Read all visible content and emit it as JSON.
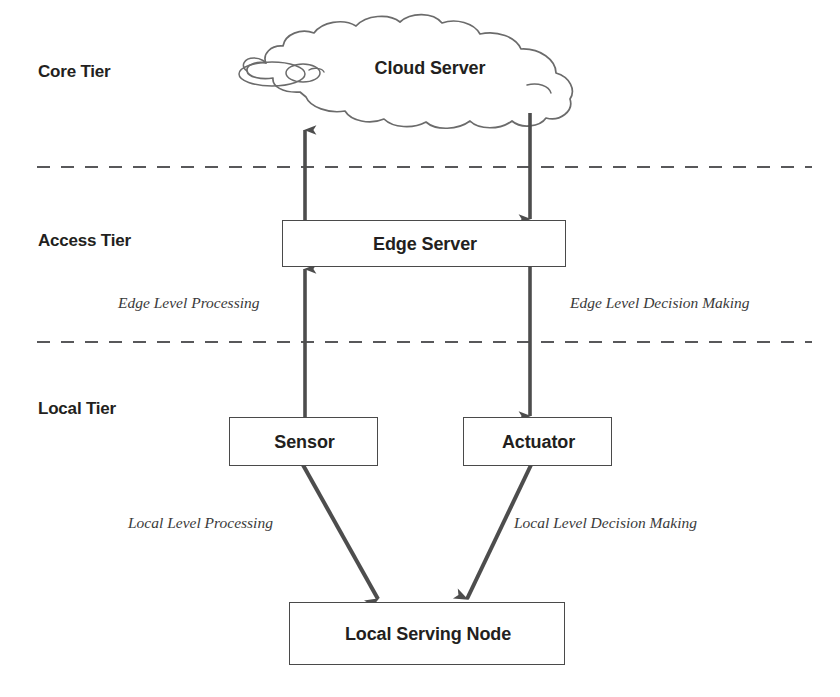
{
  "canvas": {
    "width": 840,
    "height": 697,
    "background": "#ffffff",
    "stroke_color": "#4a4a4a",
    "arrow_color": "#4d4d4d",
    "text_color": "#231f20"
  },
  "tiers": [
    {
      "id": "core",
      "label": "Core Tier"
    },
    {
      "id": "access",
      "label": "Access Tier"
    },
    {
      "id": "local",
      "label": "Local Tier"
    }
  ],
  "nodes": [
    {
      "id": "cloud-server",
      "label": "Cloud Server",
      "shape": "cloud",
      "tier": "core"
    },
    {
      "id": "edge-server",
      "label": "Edge Server",
      "shape": "rectangle",
      "tier": "access"
    },
    {
      "id": "sensor",
      "label": "Sensor",
      "shape": "rectangle",
      "tier": "local"
    },
    {
      "id": "actuator",
      "label": "Actuator",
      "shape": "rectangle",
      "tier": "local"
    },
    {
      "id": "local-serving-node",
      "label": "Local Serving Node",
      "shape": "rectangle",
      "tier": "local"
    }
  ],
  "connections": [
    {
      "id": "edge-to-cloud",
      "from": "edge-server",
      "to": "cloud-server",
      "direction": "up",
      "label": ""
    },
    {
      "id": "cloud-to-edge",
      "from": "cloud-server",
      "to": "edge-server",
      "direction": "down",
      "label": ""
    },
    {
      "id": "sensor-to-edge",
      "from": "sensor",
      "to": "edge-server",
      "direction": "up",
      "label": "Edge Level Processing"
    },
    {
      "id": "edge-to-actuator",
      "from": "edge-server",
      "to": "actuator",
      "direction": "down",
      "label": "Edge Level Decision Making"
    },
    {
      "id": "sensor-to-local-node",
      "from": "sensor",
      "to": "local-serving-node",
      "direction": "diagonal-down-right",
      "label": "Local Level Processing"
    },
    {
      "id": "actuator-to-local-node",
      "from": "actuator",
      "to": "local-serving-node",
      "direction": "diagonal-down-left",
      "label": "Local Level Decision Making"
    }
  ],
  "edge_labels": {
    "edge_level_processing": "Edge Level Processing",
    "edge_level_decision_making": "Edge Level Decision Making",
    "local_level_processing": "Local Level Processing",
    "local_level_decision_making": "Local Level Decision Making"
  },
  "dividers": [
    {
      "id": "core-access-divider",
      "style": "dashed"
    },
    {
      "id": "access-local-divider",
      "style": "dashed"
    }
  ]
}
